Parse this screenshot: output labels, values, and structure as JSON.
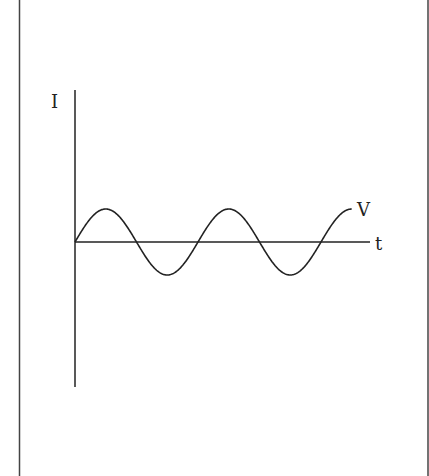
{
  "diagram": {
    "type": "sinusoidal-waveform",
    "y_axis_label": "I",
    "x_axis_label": "t",
    "curve_label": "V",
    "colors": {
      "stroke": "#222222",
      "background": "#ffffff",
      "border": "#444444"
    },
    "wave": {
      "origin_px": [
        75,
        242
      ],
      "amplitude_px": 33,
      "period_px": 123,
      "start_phase": "0 (sine, rising from origin)",
      "cycles_shown": 2.25
    }
  }
}
